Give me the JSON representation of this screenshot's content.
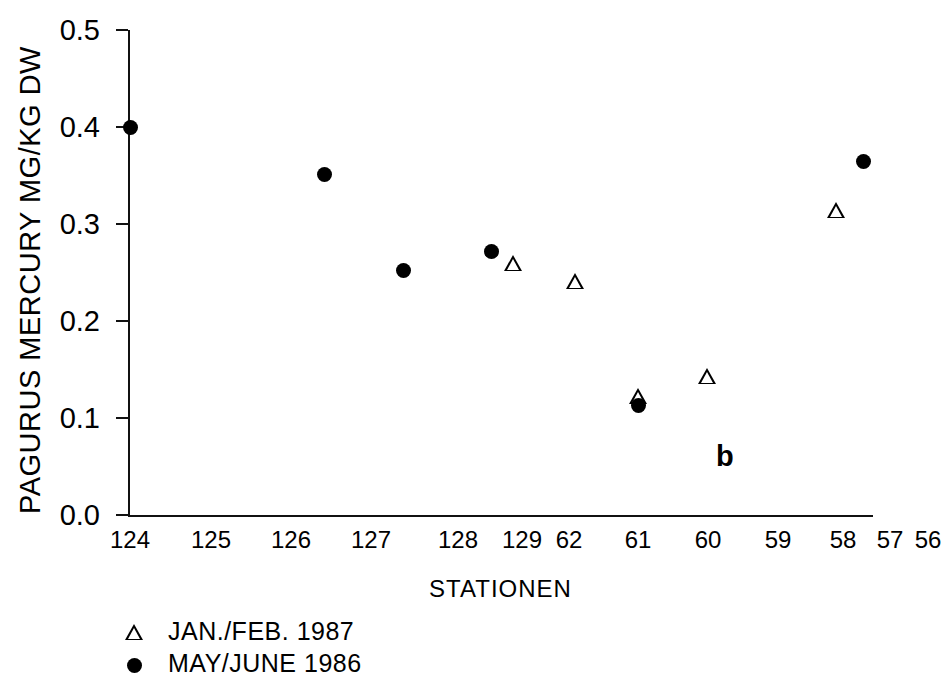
{
  "chart_data": {
    "type": "scatter",
    "title": "",
    "panel_label": "b",
    "xlabel": "STATIONEN",
    "ylabel": "PAGURUS MERCURY MG/KG DW",
    "categories": [
      "124",
      "125",
      "126",
      "127",
      "128",
      "129",
      "62",
      "61",
      "60",
      "59",
      "58",
      "57",
      "56"
    ],
    "yticks": [
      "0.0",
      "0.1",
      "0.2",
      "0.3",
      "0.4",
      "0.5"
    ],
    "ylim": [
      0.0,
      0.5
    ],
    "grid": false,
    "legend_position": "below-left",
    "series": [
      {
        "name": "JAN./FEB. 1987",
        "marker": "open-triangle",
        "color": "#000000",
        "points": [
          {
            "category": "62",
            "value": 0.26
          },
          {
            "category": "61",
            "value": 0.241
          },
          {
            "category": "60",
            "value": 0.123
          },
          {
            "category": "59",
            "value": 0.143
          },
          {
            "category": "57",
            "value": 0.314
          }
        ]
      },
      {
        "name": "MAY/JUNE 1986",
        "marker": "filled-circle",
        "color": "#000000",
        "points": [
          {
            "category": "124",
            "value": 0.4
          },
          {
            "category": "127",
            "value": 0.351
          },
          {
            "category": "128",
            "value": 0.252
          },
          {
            "category": "129",
            "value": 0.272
          },
          {
            "category": "60",
            "value": 0.113
          },
          {
            "category": "56",
            "value": 0.364
          }
        ]
      }
    ]
  },
  "legend": {
    "entries": [
      {
        "label": "JAN./FEB. 1987",
        "marker": "triangle-marker-icon"
      },
      {
        "label": "MAY/JUNE 1986",
        "marker": "circle-marker-icon"
      }
    ]
  }
}
